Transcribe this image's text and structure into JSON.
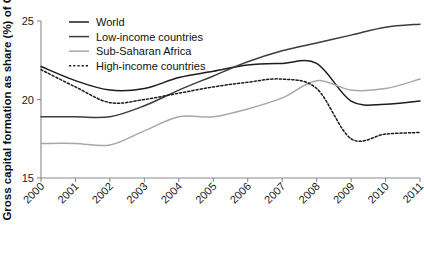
{
  "chart_data": {
    "type": "line",
    "title": "",
    "xlabel": "",
    "ylabel": "Gross capital formation as share (%) of GDP",
    "x": [
      2000,
      2001,
      2002,
      2003,
      2004,
      2005,
      2006,
      2007,
      2008,
      2009,
      2010,
      2011
    ],
    "categories": [
      "2000",
      "2001",
      "2002",
      "2003",
      "2004",
      "2005",
      "2006",
      "2007",
      "2008",
      "2009",
      "2010",
      "2011"
    ],
    "xlim": [
      2000,
      2011
    ],
    "ylim": [
      15,
      25
    ],
    "yticks": [
      15,
      20,
      25
    ],
    "ytick_labels": [
      "15",
      "20",
      "25"
    ],
    "grid": false,
    "legend_position": "top-left",
    "series": [
      {
        "name": "World",
        "color": "#1c1c1c",
        "width": 1.5,
        "dash": "none",
        "values": [
          22.1,
          21.2,
          20.6,
          20.7,
          21.4,
          21.8,
          22.2,
          22.3,
          22.3,
          19.9,
          19.7,
          19.9
        ]
      },
      {
        "name": "Low-income countries",
        "color": "#3c3c3c",
        "width": 1.5,
        "dash": "none",
        "values": [
          18.9,
          18.9,
          18.9,
          19.6,
          20.6,
          21.5,
          22.4,
          23.1,
          23.6,
          24.1,
          24.6,
          24.8
        ]
      },
      {
        "name": "Sub-Saharan Africa",
        "color": "#a8a8a8",
        "width": 1.5,
        "dash": "none",
        "values": [
          17.2,
          17.2,
          17.1,
          18.0,
          18.9,
          18.9,
          19.4,
          20.1,
          21.2,
          20.6,
          20.7,
          21.3
        ]
      },
      {
        "name": "High-income countries",
        "color": "#1c1c1c",
        "width": 1.5,
        "dash": "2.2,2.0",
        "values": [
          21.9,
          20.8,
          19.8,
          20.0,
          20.4,
          20.8,
          21.1,
          21.3,
          20.7,
          17.5,
          17.8,
          17.9
        ]
      }
    ],
    "annotations": []
  },
  "legend": {
    "items": [
      {
        "label": "World"
      },
      {
        "label": "Low-income countries"
      },
      {
        "label": "Sub-Saharan Africa"
      },
      {
        "label": "High-income countries"
      }
    ]
  }
}
